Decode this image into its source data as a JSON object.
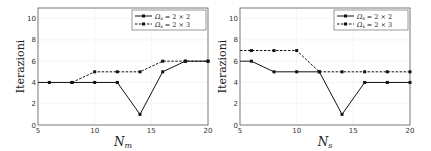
{
  "chart_data": [
    {
      "type": "line",
      "title": "",
      "xlabel": "N_m",
      "ylabel": "Iterazioni",
      "xlim": [
        5,
        20
      ],
      "ylim": [
        0,
        11
      ],
      "xticks": [
        5,
        10,
        15,
        20
      ],
      "yticks": [
        0,
        2,
        4,
        6,
        8,
        10
      ],
      "grid": true,
      "legend_position": "upper right",
      "series": [
        {
          "name": "Ω_s = 2 × 2",
          "style": "solid",
          "x": [
            5,
            6,
            8,
            10,
            12,
            14,
            16,
            18,
            20
          ],
          "values": [
            4,
            4,
            4,
            4,
            4,
            1,
            5,
            6,
            6
          ]
        },
        {
          "name": "Ω_s = 2 × 3",
          "style": "dashed",
          "x": [
            8,
            10,
            12,
            14,
            16,
            18,
            20
          ],
          "values": [
            4,
            5,
            5,
            5,
            6,
            6,
            6
          ]
        }
      ]
    },
    {
      "type": "line",
      "title": "",
      "xlabel": "N_s",
      "ylabel": "Iterazioni",
      "xlim": [
        5,
        20
      ],
      "ylim": [
        0,
        11
      ],
      "xticks": [
        5,
        10,
        15,
        20
      ],
      "yticks": [
        0,
        2,
        4,
        6,
        8,
        10
      ],
      "grid": true,
      "legend_position": "upper right",
      "series": [
        {
          "name": "Ω_s = 2 × 2",
          "style": "solid",
          "x": [
            5,
            6,
            8,
            10,
            12,
            14,
            16,
            18,
            20
          ],
          "values": [
            6,
            6,
            5,
            5,
            5,
            1,
            4,
            4,
            4
          ]
        },
        {
          "name": "Ω_s = 2 × 3",
          "style": "dashed",
          "x": [
            5,
            6,
            8,
            10,
            12,
            14,
            16,
            18,
            20
          ],
          "values": [
            7,
            7,
            7,
            7,
            5,
            5,
            5,
            5,
            5
          ]
        }
      ]
    }
  ],
  "labels": {
    "ylabel": "Iterazioni",
    "xlabel_left_main": "N",
    "xlabel_left_sub": "m",
    "xlabel_right_main": "N",
    "xlabel_right_sub": "s",
    "legend1": "Ω",
    "legend1_sub": "s",
    "legend1_rest": " = 2 × 2",
    "legend2": "Ω",
    "legend2_sub": "s",
    "legend2_rest": " = 2 × 3"
  }
}
